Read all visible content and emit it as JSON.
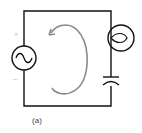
{
  "figure": {
    "caption": "(a)",
    "source_polarity_plus": "+",
    "source_polarity_minus": "−"
  },
  "components": [
    {
      "type": "ac-voltage-source",
      "position": "left"
    },
    {
      "type": "lamp",
      "position": "right-top"
    },
    {
      "type": "capacitor",
      "position": "right-bottom"
    }
  ],
  "annotations": {
    "current_loop_arrow": "counterclockwise"
  },
  "colors": {
    "wire": "#111111",
    "arrow": "#8a8a8a",
    "polarity": "#bbbbbb",
    "caption": "#444444"
  }
}
